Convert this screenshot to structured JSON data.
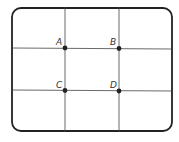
{
  "diagram": {
    "frame": {
      "x": 12,
      "y": 8,
      "width": 160,
      "height": 123,
      "radius": 9,
      "stroke": "#222222",
      "stroke_width": 1.8
    },
    "grid_lines": {
      "vertical_x": [
        65,
        119
      ],
      "horizontal_y": [
        48,
        91
      ],
      "stroke": "#444444"
    },
    "points": [
      {
        "id": "A",
        "label": "A",
        "x": 65,
        "y": 48
      },
      {
        "id": "B",
        "label": "B",
        "x": 119,
        "y": 48
      },
      {
        "id": "C",
        "label": "C",
        "x": 65,
        "y": 91
      },
      {
        "id": "D",
        "label": "D",
        "x": 119,
        "y": 91
      }
    ],
    "point_color": "#222222"
  }
}
